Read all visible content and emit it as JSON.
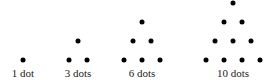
{
  "figure": {
    "groups": [
      {
        "label": "1 dot",
        "count": 1,
        "label_x": 23,
        "dots": [
          [
            23,
            60
          ]
        ]
      },
      {
        "label": "3 dots",
        "count": 3,
        "label_x": 78,
        "dots": [
          [
            78,
            41
          ],
          [
            69,
            60
          ],
          [
            87,
            60
          ]
        ]
      },
      {
        "label": "6 dots",
        "count": 6,
        "label_x": 142,
        "dots": [
          [
            142,
            22
          ],
          [
            133,
            41
          ],
          [
            151,
            41
          ],
          [
            124,
            60
          ],
          [
            142,
            60
          ],
          [
            160,
            60
          ]
        ]
      },
      {
        "label": "10 dots",
        "count": 10,
        "label_x": 233,
        "dots": [
          [
            233,
            3
          ],
          [
            224,
            22
          ],
          [
            242,
            22
          ],
          [
            215,
            41
          ],
          [
            233,
            41
          ],
          [
            251,
            41
          ],
          [
            206,
            60
          ],
          [
            224,
            60
          ],
          [
            242,
            60
          ],
          [
            260,
            60
          ]
        ]
      }
    ],
    "dot_color": "#000000",
    "label_color": "#222222"
  }
}
